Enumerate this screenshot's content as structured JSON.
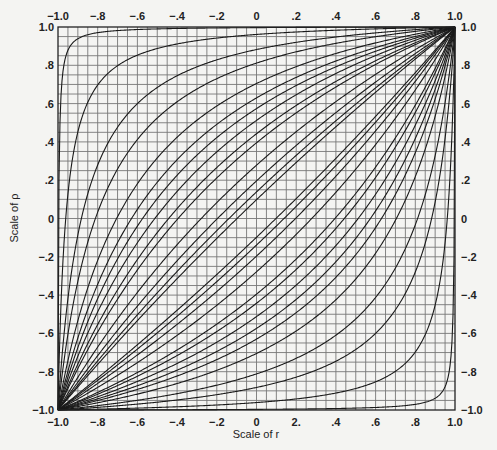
{
  "chart_data": {
    "type": "line",
    "title": "",
    "xlabel": "Scale of r",
    "ylabel": "Scale of ρ",
    "xlim": [
      -1.0,
      1.0
    ],
    "ylim": [
      -1.0,
      1.0
    ],
    "grid": true,
    "grid_step": 0.05,
    "legend": "none (curves labelled inline with sample sizes)",
    "x_ticks": [
      "−1.0",
      "−.8",
      "−.6",
      "−.4",
      "−.2",
      "0",
      "2.",
      ".4",
      ".6",
      ".8",
      "1.0"
    ],
    "x_ticks_top": [
      "−1.0",
      "−.8",
      "−.6",
      "−.4",
      "−.2",
      "0",
      ".2",
      ".4",
      ".6",
      ".8",
      "1.0"
    ],
    "y_ticks": [
      "1.0",
      ".8",
      ".6",
      ".4",
      ".2",
      "0",
      "−.2",
      "−.4",
      "−.6",
      "−.8",
      "−1.0"
    ],
    "y_ticks_right": [
      "1.0",
      ".8",
      ".6",
      ".4",
      ".2",
      "0",
      "−.2",
      "−.4",
      "−.6",
      "−.8",
      "−1.0"
    ],
    "confidence_z": 1.96,
    "sample_sizes": [
      3,
      4,
      5,
      6,
      8,
      10,
      12,
      15,
      20,
      25,
      50,
      100,
      200,
      400
    ],
    "sample_sizes_note": "Assumed from the standard version of this chart; inline curve labels are not legible in the screenshot.",
    "series": [
      {
        "name": "lower limits (curves above diagonal, labelled upper-left)",
        "side": 1
      },
      {
        "name": "upper limits (curves below diagonal, labelled lower-right)",
        "side": -1
      }
    ]
  }
}
